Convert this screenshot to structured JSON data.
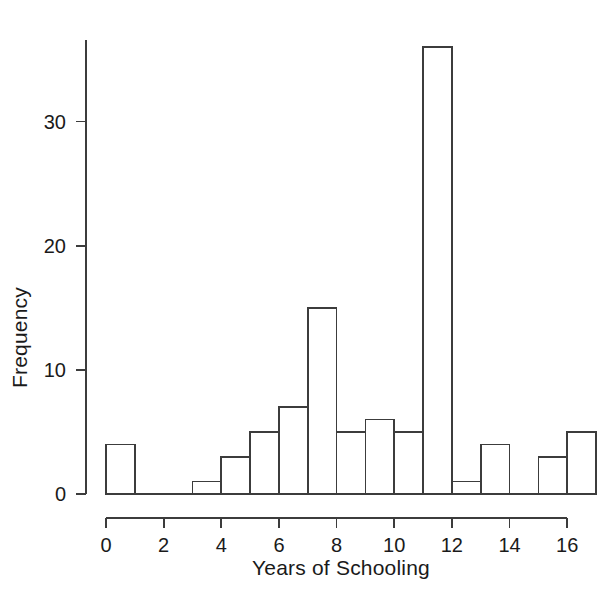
{
  "chart_data": {
    "type": "bar",
    "subtype": "histogram",
    "title": "",
    "xlabel": "Years of Schooling",
    "ylabel": "Frequency",
    "xlim": [
      0,
      17
    ],
    "ylim": [
      0,
      36
    ],
    "grid": false,
    "legend": null,
    "bin_width": 1,
    "bin_edges": [
      0,
      1,
      2,
      3,
      4,
      5,
      6,
      7,
      8,
      9,
      10,
      11,
      12,
      13,
      14,
      15,
      16,
      17
    ],
    "categories": [
      "0-1",
      "1-2",
      "2-3",
      "3-4",
      "4-5",
      "5-6",
      "6-7",
      "7-8",
      "8-9",
      "9-10",
      "10-11",
      "11-12",
      "12-13",
      "13-14",
      "14-15",
      "15-16",
      "16-17"
    ],
    "values": [
      4,
      0,
      0,
      1,
      3,
      5,
      7,
      15,
      5,
      6,
      5,
      36,
      1,
      4,
      0,
      3,
      5
    ],
    "xticks": [
      0,
      2,
      4,
      6,
      8,
      10,
      12,
      14,
      16
    ],
    "xtick_labels": [
      "0",
      "2",
      "4",
      "6",
      "8",
      "10",
      "12",
      "14",
      "16"
    ],
    "yticks": [
      0,
      10,
      20,
      30
    ],
    "ytick_labels": [
      "0",
      "10",
      "20",
      "30"
    ],
    "bar_fill": "#ffffff",
    "bar_stroke": "#3c3c3c",
    "axis_color": "#3c3c3c",
    "text_color": "#1a1a1a",
    "background": "#ffffff"
  },
  "axes": {
    "x_axis_label": "Years of Schooling",
    "y_axis_label": "Frequency"
  }
}
